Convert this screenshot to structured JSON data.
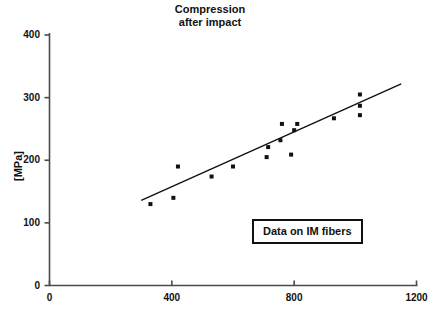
{
  "chart_data": {
    "type": "scatter",
    "title": "Compression\nafter impact",
    "title_lines": [
      "Compression",
      "after impact"
    ],
    "xlabel": "",
    "ylabel": "[MPa]",
    "xlim": [
      0,
      1200
    ],
    "ylim": [
      0,
      400
    ],
    "xticks": [
      0,
      400,
      800,
      1200
    ],
    "yticks": [
      0,
      100,
      200,
      300,
      400
    ],
    "xtick_labels": [
      "0",
      "400",
      "800",
      "1200"
    ],
    "ytick_labels": [
      "0",
      "100",
      "200",
      "300",
      "400"
    ],
    "grid": false,
    "legend_position": "inside-lower-right",
    "annotations": [
      {
        "text": "Data on IM fibers",
        "boxed": true
      }
    ],
    "series": [
      {
        "name": "Data on IM fibers",
        "type": "scatter",
        "marker": "square",
        "marker_size": 4,
        "color": "#111111",
        "points": [
          {
            "x": 330,
            "y": 130
          },
          {
            "x": 405,
            "y": 140
          },
          {
            "x": 420,
            "y": 190
          },
          {
            "x": 530,
            "y": 174
          },
          {
            "x": 600,
            "y": 190
          },
          {
            "x": 710,
            "y": 205
          },
          {
            "x": 715,
            "y": 221
          },
          {
            "x": 755,
            "y": 232
          },
          {
            "x": 760,
            "y": 258
          },
          {
            "x": 790,
            "y": 209
          },
          {
            "x": 800,
            "y": 248
          },
          {
            "x": 810,
            "y": 258
          },
          {
            "x": 930,
            "y": 267
          },
          {
            "x": 1015,
            "y": 305
          },
          {
            "x": 1015,
            "y": 287
          },
          {
            "x": 1015,
            "y": 272
          }
        ]
      },
      {
        "name": "trend line",
        "type": "line",
        "color": "#111111",
        "width": 1.4,
        "points": [
          {
            "x": 300,
            "y": 136
          },
          {
            "x": 1150,
            "y": 322
          }
        ]
      }
    ]
  },
  "axes": {
    "axis_color": "#4a4a4a",
    "tick_color": "#4a4a4a",
    "text_color": "#111111"
  }
}
